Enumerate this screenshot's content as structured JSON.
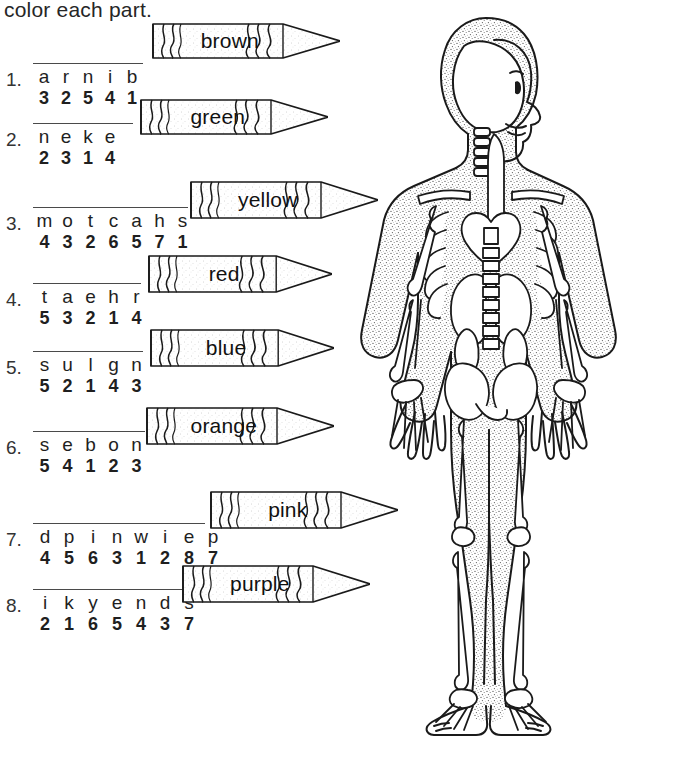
{
  "worksheet": {
    "title": "color each part.",
    "line_color": "#4a4a4a",
    "ink_color": "#1a1a1a"
  },
  "puzzles": [
    {
      "number": "1.",
      "letters": [
        "a",
        "r",
        "n",
        "i",
        "b"
      ],
      "numbers": [
        "3",
        "2",
        "5",
        "4",
        "1"
      ],
      "crayon": {
        "label": "brown"
      }
    },
    {
      "number": "2.",
      "letters": [
        "n",
        "e",
        "k",
        "e"
      ],
      "numbers": [
        "2",
        "3",
        "1",
        "4"
      ],
      "crayon": {
        "label": "green"
      }
    },
    {
      "number": "3.",
      "letters": [
        "m",
        "o",
        "t",
        "c",
        "a",
        "h",
        "s"
      ],
      "numbers": [
        "4",
        "3",
        "2",
        "6",
        "5",
        "7",
        "1"
      ],
      "crayon": {
        "label": "yellow"
      }
    },
    {
      "number": "4.",
      "letters": [
        "t",
        "a",
        "e",
        "h",
        "r"
      ],
      "numbers": [
        "5",
        "3",
        "2",
        "1",
        "4"
      ],
      "crayon": {
        "label": "red"
      }
    },
    {
      "number": "5.",
      "letters": [
        "s",
        "u",
        "l",
        "g",
        "n"
      ],
      "numbers": [
        "5",
        "2",
        "1",
        "4",
        "3"
      ],
      "crayon": {
        "label": "blue"
      }
    },
    {
      "number": "6.",
      "letters": [
        "s",
        "e",
        "b",
        "o",
        "n"
      ],
      "numbers": [
        "5",
        "4",
        "1",
        "2",
        "3"
      ],
      "crayon": {
        "label": "orange"
      }
    },
    {
      "number": "7.",
      "letters": [
        "d",
        "p",
        "i",
        "n",
        "w",
        "i",
        "e",
        "p"
      ],
      "numbers": [
        "4",
        "5",
        "6",
        "3",
        "1",
        "2",
        "8",
        "7"
      ],
      "crayon": {
        "label": "pink"
      }
    },
    {
      "number": "8.",
      "letters": [
        "i",
        "k",
        "y",
        "e",
        "n",
        "d",
        "s"
      ],
      "numbers": [
        "2",
        "1",
        "6",
        "5",
        "4",
        "3",
        "7"
      ],
      "crayon": {
        "label": "purple"
      }
    }
  ],
  "illustration": {
    "name": "child-skeleton-anatomy-figure",
    "description": "line drawing of a standing child showing skull, spine, ribs, heart, lungs, pelvis and limb bones"
  }
}
